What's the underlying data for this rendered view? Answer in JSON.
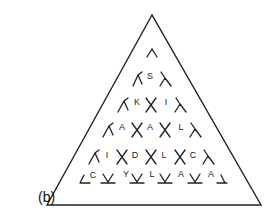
{
  "panel_label": "(b)",
  "triangle": {
    "apex": [
      152,
      15
    ],
    "bottom_left": [
      47,
      205
    ],
    "bottom_right": [
      261,
      205
    ]
  },
  "rows": [
    {
      "letters": []
    },
    {
      "letters": [
        "S"
      ]
    },
    {
      "letters": [
        "K",
        "I"
      ]
    },
    {
      "letters": [
        "A",
        "A",
        "L"
      ]
    },
    {
      "letters": [
        "I",
        "D",
        "L",
        "C"
      ]
    },
    {
      "letters": [
        "C",
        "Y",
        "L",
        "A",
        "A"
      ]
    }
  ],
  "letter_positions": {
    "0": [],
    "1": [
      [
        150,
        79
      ]
    ],
    "2": [
      [
        137,
        105
      ],
      [
        166,
        105
      ]
    ],
    "3": [
      [
        122,
        130
      ],
      [
        150,
        130
      ],
      [
        181,
        130
      ]
    ],
    "4": [
      [
        107,
        158
      ],
      [
        135,
        158
      ],
      [
        164,
        158
      ],
      [
        193,
        158
      ]
    ],
    "5": [
      [
        93,
        178
      ],
      [
        126,
        177
      ],
      [
        152,
        177
      ],
      [
        181,
        177
      ],
      [
        211,
        177
      ]
    ]
  },
  "colors": {
    "ink": "#222222",
    "background": "#ffffff"
  }
}
